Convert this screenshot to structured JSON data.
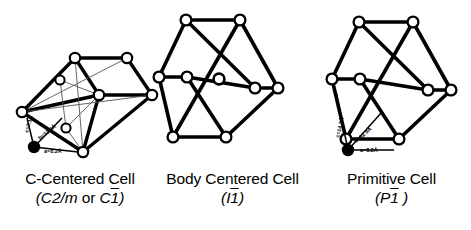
{
  "figure": {
    "background_color": "#ffffff",
    "line_color": "#000000",
    "node_fill": "#ffffff",
    "origin_fill": "#000000",
    "thin_line_color": "#444444"
  },
  "cells": [
    {
      "id": "c-centered",
      "name": "C-Centered Cell",
      "caption_title": "C-Centered Cell",
      "space_group_prefix": "(",
      "space_group_part1": "C2/m",
      "space_group_conj": "or",
      "space_group_part2_letter": "C",
      "space_group_part2_bar": "1",
      "space_group_suffix": ")",
      "has_center_atom": false,
      "has_internal_lines": true,
      "axes": [
        {
          "key": "c",
          "symbol": "c",
          "label": "c=7.1Å",
          "value": 7.1,
          "unit": "Å"
        },
        {
          "key": "b",
          "symbol": "b",
          "label": "b=12.9Å",
          "value": 12.9,
          "unit": "Å"
        },
        {
          "key": "a",
          "symbol": "a",
          "label": "a=8.2Å",
          "value": 8.2,
          "unit": "Å"
        }
      ]
    },
    {
      "id": "body-centered",
      "name": "Body Centered Cell",
      "caption_title": "Body Centered Cell",
      "space_group_prefix": "(",
      "space_group_part1": "",
      "space_group_conj": "",
      "space_group_part2_letter": "I",
      "space_group_part2_bar": "1",
      "space_group_suffix": ")",
      "has_center_atom": true,
      "has_internal_lines": false,
      "axes": []
    },
    {
      "id": "primitive",
      "name": "Primitive Cell",
      "caption_title": "Primitive Cell",
      "space_group_prefix": "(",
      "space_group_part1": "",
      "space_group_conj": "",
      "space_group_part2_letter": "P",
      "space_group_part2_bar": "1",
      "space_group_suffix": " )",
      "has_center_atom": false,
      "has_internal_lines": false,
      "axes": [
        {
          "key": "c",
          "symbol": "c",
          "label": "c=14.2Å",
          "value": 14.2,
          "unit": "Å"
        },
        {
          "key": "b",
          "symbol": "b",
          "label": "b=12.9Å",
          "value": 12.9,
          "unit": "Å"
        },
        {
          "key": "a",
          "symbol": "a",
          "label": "a=8.2Å",
          "value": 8.2,
          "unit": "Å"
        }
      ]
    }
  ]
}
